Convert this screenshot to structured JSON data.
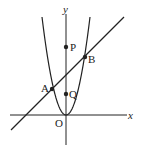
{
  "diagram": {
    "title": "",
    "axes": {
      "x_label": "x",
      "y_label": "y",
      "origin_label": "O"
    },
    "points": [
      {
        "id": "A",
        "label": "A",
        "px": 52,
        "py": 89
      },
      {
        "id": "B",
        "label": "B",
        "px": 85,
        "py": 57
      },
      {
        "id": "P",
        "label": "P",
        "px": 66,
        "py": 47
      },
      {
        "id": "Q",
        "label": "Q",
        "px": 66,
        "py": 94
      }
    ],
    "curves": [
      {
        "id": "parabola",
        "kind": "parabola",
        "description": "y = ax^2 through origin"
      },
      {
        "id": "line",
        "kind": "line",
        "description": "line through A and B"
      }
    ],
    "colors": {
      "stroke": "#222222",
      "background": "#ffffff"
    }
  }
}
